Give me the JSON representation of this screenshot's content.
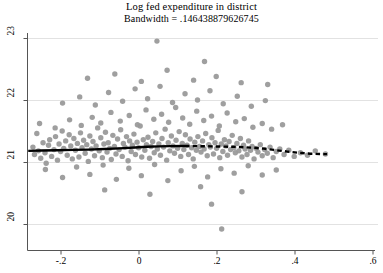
{
  "chart_data": {
    "type": "scatter",
    "title": "Log fed expenditure in district",
    "subtitle": "Bandwidth = .146438879626745",
    "xlabel": "",
    "ylabel": "",
    "xlim": [
      -0.287,
      0.6
    ],
    "ylim": [
      19.6,
      23.35
    ],
    "xticks": [
      -0.2,
      0,
      0.2,
      0.4,
      0.6
    ],
    "xticklabels": [
      "-.2",
      "0",
      ".2",
      ".4",
      ".6"
    ],
    "yticks": [
      20,
      21,
      22,
      23
    ],
    "yticklabels": [
      "20",
      "21",
      "22",
      "23"
    ],
    "grid": "horizontal",
    "legend": "none",
    "marker_color": "#9a9a9a",
    "line_color": "#000000",
    "series": [
      {
        "name": "observations",
        "type": "scatter",
        "points": [
          [
            -0.272,
            21.24
          ],
          [
            -0.268,
            21.12
          ],
          [
            -0.262,
            21.46
          ],
          [
            -0.258,
            21.18
          ],
          [
            -0.252,
            21.06
          ],
          [
            -0.246,
            21.31
          ],
          [
            -0.241,
            21.15
          ],
          [
            -0.238,
            20.98
          ],
          [
            -0.232,
            21.27
          ],
          [
            -0.229,
            21.36
          ],
          [
            -0.224,
            21.09
          ],
          [
            -0.218,
            21.2
          ],
          [
            -0.214,
            21.41
          ],
          [
            -0.209,
            21.03
          ],
          [
            -0.205,
            21.29
          ],
          [
            -0.201,
            21.17
          ],
          [
            -0.197,
            21.5
          ],
          [
            -0.193,
            21.22
          ],
          [
            -0.188,
            21.34
          ],
          [
            -0.184,
            21.11
          ],
          [
            -0.179,
            21.44
          ],
          [
            -0.175,
            21.26
          ],
          [
            -0.171,
            21.05
          ],
          [
            -0.167,
            21.38
          ],
          [
            -0.163,
            21.19
          ],
          [
            -0.158,
            21.3
          ],
          [
            -0.154,
            21.08
          ],
          [
            -0.15,
            21.47
          ],
          [
            -0.146,
            21.23
          ],
          [
            -0.142,
            21.35
          ],
          [
            -0.138,
            21.14
          ],
          [
            -0.134,
            21.28
          ],
          [
            -0.13,
            21.01
          ],
          [
            -0.126,
            21.42
          ],
          [
            -0.122,
            21.21
          ],
          [
            -0.118,
            21.33
          ],
          [
            -0.114,
            21.1
          ],
          [
            -0.11,
            21.26
          ],
          [
            -0.106,
            21.55
          ],
          [
            -0.102,
            21.18
          ],
          [
            -0.098,
            21.39
          ],
          [
            -0.094,
            21.07
          ],
          [
            -0.09,
            21.29
          ],
          [
            -0.086,
            21.48
          ],
          [
            -0.082,
            21.16
          ],
          [
            -0.079,
            21.31
          ],
          [
            -0.075,
            21.22
          ],
          [
            -0.071,
            21.04
          ],
          [
            -0.067,
            21.43
          ],
          [
            -0.063,
            21.25
          ],
          [
            -0.059,
            21.13
          ],
          [
            -0.055,
            21.37
          ],
          [
            -0.051,
            21.2
          ],
          [
            -0.047,
            21.52
          ],
          [
            -0.043,
            21.09
          ],
          [
            -0.04,
            21.3
          ],
          [
            -0.036,
            21.24
          ],
          [
            -0.032,
            21.41
          ],
          [
            -0.028,
            21.02
          ],
          [
            -0.024,
            21.34
          ],
          [
            -0.02,
            21.17
          ],
          [
            -0.017,
            21.27
          ],
          [
            -0.013,
            21.45
          ],
          [
            -0.009,
            21.12
          ],
          [
            -0.005,
            21.32
          ],
          [
            -0.001,
            21.23
          ],
          [
            0.003,
            21.58
          ],
          [
            0.007,
            21.08
          ],
          [
            0.011,
            21.36
          ],
          [
            0.015,
            21.19
          ],
          [
            0.019,
            21.28
          ],
          [
            0.023,
            21.4
          ],
          [
            0.027,
            21.06
          ],
          [
            0.031,
            21.25
          ],
          [
            0.035,
            21.33
          ],
          [
            0.039,
            21.15
          ],
          [
            0.043,
            21.47
          ],
          [
            0.047,
            21.21
          ],
          [
            0.051,
            21.29
          ],
          [
            0.055,
            21.11
          ],
          [
            0.059,
            21.38
          ],
          [
            0.063,
            21.24
          ],
          [
            0.067,
            21.53
          ],
          [
            0.071,
            21.03
          ],
          [
            0.075,
            21.31
          ],
          [
            0.079,
            21.18
          ],
          [
            0.083,
            21.42
          ],
          [
            0.087,
            21.26
          ],
          [
            0.091,
            21.14
          ],
          [
            0.095,
            21.35
          ],
          [
            0.099,
            21.22
          ],
          [
            0.103,
            21.49
          ],
          [
            0.107,
            21.09
          ],
          [
            0.111,
            21.3
          ],
          [
            0.115,
            21.2
          ],
          [
            0.119,
            21.44
          ],
          [
            0.123,
            21.27
          ],
          [
            0.127,
            21.12
          ],
          [
            0.131,
            21.37
          ],
          [
            0.135,
            21.23
          ],
          [
            0.139,
            21.05
          ],
          [
            0.143,
            21.32
          ],
          [
            0.147,
            21.19
          ],
          [
            0.151,
            21.41
          ],
          [
            0.155,
            21.25
          ],
          [
            0.159,
            21.16
          ],
          [
            0.163,
            21.34
          ],
          [
            0.167,
            21.21
          ],
          [
            0.171,
            21.46
          ],
          [
            0.175,
            21.1
          ],
          [
            0.179,
            21.28
          ],
          [
            0.183,
            21.24
          ],
          [
            0.187,
            21.39
          ],
          [
            0.191,
            21.13
          ],
          [
            0.195,
            21.31
          ],
          [
            0.199,
            21.22
          ],
          [
            0.203,
            21.51
          ],
          [
            0.207,
            21.07
          ],
          [
            0.211,
            21.29
          ],
          [
            0.215,
            21.17
          ],
          [
            0.219,
            21.36
          ],
          [
            0.223,
            21.26
          ],
          [
            0.227,
            21.11
          ],
          [
            0.231,
            21.33
          ],
          [
            0.235,
            21.2
          ],
          [
            0.239,
            21.43
          ],
          [
            0.243,
            21.23
          ],
          [
            0.247,
            21.15
          ],
          [
            0.251,
            21.3
          ],
          [
            0.256,
            21.18
          ],
          [
            0.26,
            21.38
          ],
          [
            0.264,
            21.08
          ],
          [
            0.268,
            21.27
          ],
          [
            0.272,
            21.21
          ],
          [
            0.277,
            21.12
          ],
          [
            0.281,
            21.34
          ],
          [
            0.286,
            21.19
          ],
          [
            0.29,
            21.25
          ],
          [
            0.295,
            21.05
          ],
          [
            0.3,
            21.22
          ],
          [
            0.305,
            21.16
          ],
          [
            0.311,
            21.28
          ],
          [
            0.316,
            21.1
          ],
          [
            0.322,
            21.2
          ],
          [
            0.329,
            21.14
          ],
          [
            0.336,
            21.24
          ],
          [
            0.344,
            21.07
          ],
          [
            0.352,
            21.17
          ],
          [
            0.361,
            21.21
          ],
          [
            0.372,
            21.12
          ],
          [
            0.384,
            21.19
          ],
          [
            0.398,
            21.09
          ],
          [
            0.414,
            21.15
          ],
          [
            0.432,
            21.11
          ],
          [
            0.452,
            21.18
          ],
          [
            0.478,
            21.13
          ],
          [
            -0.255,
            21.62
          ],
          [
            -0.215,
            21.55
          ],
          [
            -0.178,
            21.68
          ],
          [
            -0.148,
            21.59
          ],
          [
            -0.12,
            21.72
          ],
          [
            -0.098,
            21.63
          ],
          [
            -0.072,
            21.8
          ],
          [
            -0.048,
            21.66
          ],
          [
            -0.025,
            21.75
          ],
          [
            -0.004,
            21.6
          ],
          [
            0.018,
            21.84
          ],
          [
            0.038,
            21.69
          ],
          [
            0.058,
            21.77
          ],
          [
            0.076,
            21.64
          ],
          [
            0.094,
            21.88
          ],
          [
            0.112,
            21.71
          ],
          [
            0.13,
            21.61
          ],
          [
            0.148,
            21.82
          ],
          [
            0.166,
            21.67
          ],
          [
            0.186,
            21.74
          ],
          [
            0.206,
            21.58
          ],
          [
            0.226,
            21.79
          ],
          [
            0.248,
            21.65
          ],
          [
            0.27,
            21.7
          ],
          [
            0.292,
            21.56
          ],
          [
            0.316,
            21.62
          ],
          [
            0.34,
            21.53
          ],
          [
            0.368,
            21.6
          ],
          [
            -0.196,
            21.95
          ],
          [
            -0.152,
            22.05
          ],
          [
            -0.112,
            21.92
          ],
          [
            -0.078,
            22.12
          ],
          [
            -0.042,
            21.98
          ],
          [
            -0.01,
            22.18
          ],
          [
            0.022,
            22.02
          ],
          [
            0.054,
            22.22
          ],
          [
            0.086,
            21.96
          ],
          [
            0.118,
            22.1
          ],
          [
            0.15,
            22.0
          ],
          [
            0.182,
            22.15
          ],
          [
            0.216,
            21.94
          ],
          [
            0.252,
            22.06
          ],
          [
            0.288,
            21.9
          ],
          [
            0.324,
            21.99
          ],
          [
            -0.132,
            22.35
          ],
          [
            -0.062,
            22.42
          ],
          [
            0.006,
            22.3
          ],
          [
            0.072,
            22.48
          ],
          [
            0.14,
            22.32
          ],
          [
            0.198,
            22.38
          ],
          [
            0.262,
            22.28
          ],
          [
            0.33,
            22.25
          ],
          [
            0.046,
            22.95
          ],
          [
            0.168,
            22.62
          ],
          [
            -0.24,
            20.88
          ],
          [
            -0.196,
            20.75
          ],
          [
            -0.16,
            20.92
          ],
          [
            -0.126,
            20.8
          ],
          [
            -0.092,
            20.95
          ],
          [
            -0.058,
            20.72
          ],
          [
            -0.026,
            20.9
          ],
          [
            0.006,
            20.78
          ],
          [
            0.04,
            20.96
          ],
          [
            0.074,
            20.7
          ],
          [
            0.108,
            20.86
          ],
          [
            0.142,
            20.93
          ],
          [
            0.176,
            20.76
          ],
          [
            0.21,
            20.89
          ],
          [
            0.244,
            20.82
          ],
          [
            0.28,
            20.94
          ],
          [
            0.316,
            20.79
          ],
          [
            0.352,
            20.87
          ],
          [
            -0.088,
            20.55
          ],
          [
            0.028,
            20.48
          ],
          [
            0.158,
            20.6
          ],
          [
            0.264,
            20.52
          ],
          [
            0.186,
            20.32
          ],
          [
            0.212,
            19.92
          ]
        ]
      },
      {
        "name": "lowess-fit-solid",
        "type": "line",
        "style": "solid",
        "points": [
          [
            -0.284,
            21.18
          ],
          [
            -0.25,
            21.185
          ],
          [
            -0.21,
            21.19
          ],
          [
            -0.17,
            21.195
          ],
          [
            -0.13,
            21.2
          ],
          [
            -0.09,
            21.21
          ],
          [
            -0.05,
            21.22
          ],
          [
            -0.01,
            21.235
          ],
          [
            0.02,
            21.245
          ],
          [
            0.05,
            21.252
          ],
          [
            0.08,
            21.256
          ],
          [
            0.11,
            21.258
          ],
          [
            0.118,
            21.258
          ]
        ]
      },
      {
        "name": "lowess-fit-dashed",
        "type": "line",
        "style": "dashed",
        "points": [
          [
            0.118,
            21.258
          ],
          [
            0.15,
            21.256
          ],
          [
            0.185,
            21.252
          ],
          [
            0.22,
            21.248
          ],
          [
            0.255,
            21.242
          ],
          [
            0.29,
            21.232
          ],
          [
            0.32,
            21.215
          ],
          [
            0.35,
            21.192
          ],
          [
            0.38,
            21.168
          ],
          [
            0.41,
            21.148
          ],
          [
            0.44,
            21.134
          ],
          [
            0.465,
            21.128
          ],
          [
            0.482,
            21.127
          ]
        ]
      }
    ]
  }
}
